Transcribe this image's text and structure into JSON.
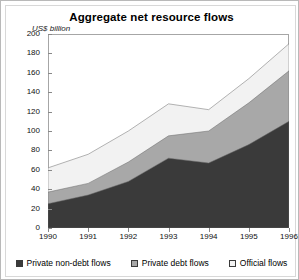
{
  "chart": {
    "title": "Aggregate net resource flows",
    "ylabel": "US$ billion"
  },
  "legend": {
    "items": [
      {
        "label": "Private non-debt flows",
        "color": "#3a3a3a",
        "name": "legend-private-non-debt-flows"
      },
      {
        "label": "Private debt flows",
        "color": "#a8a8a8",
        "name": "legend-private-debt-flows"
      },
      {
        "label": "Official flows",
        "color": "#f2f2f2",
        "name": "legend-official-flows"
      }
    ]
  },
  "axes": {
    "yticks": [
      "0",
      "20",
      "40",
      "60",
      "80",
      "100",
      "120",
      "140",
      "160",
      "180",
      "200"
    ],
    "xticks": [
      "1990",
      "1991",
      "1992",
      "1993",
      "1994",
      "1995",
      "1996"
    ]
  },
  "chart_data": {
    "type": "area",
    "stacked": true,
    "title": "Aggregate net resource flows",
    "xlabel": "",
    "ylabel": "US$ billion",
    "ylim": [
      0,
      200
    ],
    "xlim": [
      "1990",
      "1996"
    ],
    "grid": false,
    "legend_position": "bottom",
    "categories": [
      "1990",
      "1991",
      "1992",
      "1993",
      "1994",
      "1995",
      "1996"
    ],
    "series": [
      {
        "name": "Private non-debt flows",
        "color": "#3a3a3a",
        "values": [
          25,
          34,
          48,
          72,
          67,
          86,
          110
        ]
      },
      {
        "name": "Private debt flows",
        "color": "#a8a8a8",
        "values": [
          12,
          12,
          20,
          23,
          33,
          43,
          52
        ]
      },
      {
        "name": "Official flows",
        "color": "#f2f2f2",
        "values": [
          25,
          30,
          32,
          33,
          22,
          25,
          28
        ]
      }
    ],
    "totals": [
      62,
      76,
      100,
      128,
      122,
      154,
      190
    ]
  }
}
